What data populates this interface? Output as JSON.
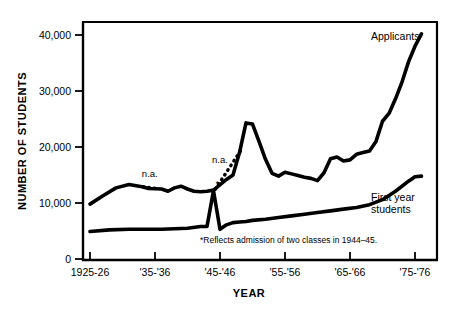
{
  "chart_data": {
    "type": "line",
    "title": "",
    "xlabel": "YEAR",
    "ylabel": "NUMBER OF STUDENTS",
    "ylim": [
      0,
      43000
    ],
    "xlim": [
      1925,
      1979
    ],
    "grid": false,
    "legend_position": "inline-right-of-series",
    "y_ticks": [
      0,
      10000,
      20000,
      30000,
      40000
    ],
    "y_tick_labels": [
      "0",
      "10,000",
      "20,000",
      "30,000",
      "40,000"
    ],
    "x_ticks": [
      1925,
      1935,
      1945,
      1955,
      1965,
      1975
    ],
    "x_tick_labels": [
      "1925-26",
      "'35-'36",
      "'45-'46",
      "'55-'56",
      "'65-'66",
      "'75-'76"
    ],
    "series": [
      {
        "name": "Applicants",
        "label": "Applicants",
        "style": "solid",
        "x": [
          1925,
          1927,
          1929,
          1931,
          1933,
          1934,
          1936,
          1937,
          1938,
          1939,
          1940,
          1941,
          1942,
          1943,
          1944,
          1946,
          1947,
          1948,
          1949,
          1950,
          1951,
          1952,
          1953,
          1954,
          1955,
          1956,
          1957,
          1958,
          1959,
          1960,
          1961,
          1962,
          1963,
          1964,
          1965,
          1966,
          1967,
          1968,
          1969,
          1970,
          1971,
          1972,
          1973,
          1974,
          1975,
          1976
        ],
        "y": [
          9800,
          11300,
          12700,
          13300,
          12900,
          12600,
          12500,
          12100,
          12700,
          13000,
          12500,
          12100,
          12000,
          12100,
          12300,
          14200,
          15000,
          19000,
          24300,
          24100,
          21000,
          17800,
          15300,
          14800,
          15500,
          15200,
          14900,
          14600,
          14400,
          14000,
          15400,
          17900,
          18200,
          17500,
          17700,
          18700,
          19000,
          19300,
          21000,
          24600,
          26000,
          28600,
          31600,
          35200,
          38000,
          40200
        ]
      },
      {
        "name": "First year students",
        "label": "First year students",
        "style": "solid",
        "x": [
          1925,
          1928,
          1931,
          1934,
          1936,
          1938,
          1940,
          1942,
          1943,
          1944,
          1945,
          1946,
          1947,
          1948,
          1949,
          1950,
          1952,
          1954,
          1956,
          1958,
          1960,
          1962,
          1964,
          1966,
          1968,
          1970,
          1972,
          1974,
          1975,
          1976
        ],
        "y": [
          4900,
          5200,
          5300,
          5300,
          5300,
          5400,
          5500,
          5800,
          5800,
          12200,
          5300,
          6100,
          6500,
          6600,
          6700,
          6900,
          7100,
          7400,
          7700,
          8000,
          8300,
          8600,
          8900,
          9200,
          9700,
          10600,
          12100,
          13900,
          14700,
          14800
        ]
      }
    ],
    "gap_segments": [
      {
        "name": "n.a.-gap-1",
        "style": "dotted",
        "label": "n.a.",
        "x": [
          1933.2,
          1935.4
        ],
        "y": [
          12900,
          12550
        ]
      },
      {
        "name": "n.a.-gap-2",
        "style": "dotted",
        "label": "n.a.",
        "x": [
          1944.3,
          1948.2
        ],
        "y": [
          12500,
          19400
        ]
      }
    ],
    "annotations": [
      {
        "name": "na-label-1",
        "text": "n.a.",
        "x": 1934.2,
        "y": 14600
      },
      {
        "name": "na-label-2",
        "text": "n.a.",
        "x": 1945.0,
        "y": 17200
      },
      {
        "name": "spike-asterisk",
        "text": "*",
        "x": 1944.6,
        "y": 12950
      }
    ],
    "footnote": "*Reflects admission of two classes in 1944–45."
  },
  "labels": {
    "y_axis_title": "NUMBER OF STUDENTS",
    "x_axis_title": "YEAR",
    "applicants": "Applicants",
    "first_year_students": "First year students",
    "na_1": "n.a.",
    "na_2": "n.a.",
    "asterisk": "*",
    "footnote": "*Reflects admission of two classes in 1944–45."
  },
  "ticks": {
    "y": [
      "40,000",
      "30,000",
      "20,000",
      "10,000",
      "0"
    ],
    "x": [
      "1925-26",
      "'35-'36",
      "'45-'46",
      "'55-'56",
      "'65-'66",
      "'75-'76"
    ]
  },
  "colors": {
    "ink": "#000000",
    "background": "#ffffff"
  }
}
